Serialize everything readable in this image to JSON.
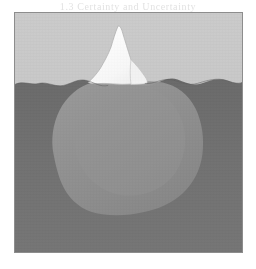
{
  "page": {
    "background_color": "#ffffff"
  },
  "ghost_text": {
    "heading": "1.3  Certainty and Uncertainty",
    "subheading": "1.3.1  The Iceberg Model"
  },
  "figure": {
    "name": "iceberg-diagram",
    "frame": {
      "border_color": "#8d8d8d",
      "x": 14,
      "y": 12,
      "width": 229,
      "height": 241
    },
    "regions": [
      {
        "id": "sky",
        "label": "Sky above the waterline",
        "color": "#c6c6c6"
      },
      {
        "id": "water",
        "label": "Water below the waterline",
        "color": "#6e6e6e"
      },
      {
        "id": "iceberg-tip",
        "label": "Visible iceberg tip",
        "color": "#fbfbfb"
      },
      {
        "id": "iceberg-submerged",
        "label": "Submerged iceberg mass",
        "color": "#8e8e8e"
      }
    ],
    "waterline": {
      "label": "Waterline",
      "color": "#5f5f5f",
      "y": 70
    }
  }
}
